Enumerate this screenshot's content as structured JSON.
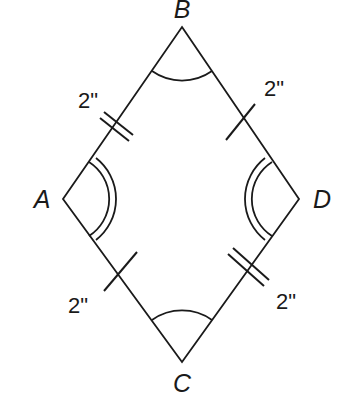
{
  "figure": {
    "type": "rhombus",
    "vertices": {
      "A": {
        "label": "A",
        "x": 63,
        "y": 199
      },
      "B": {
        "label": "B",
        "x": 182,
        "y": 27
      },
      "C": {
        "label": "C",
        "x": 182,
        "y": 362
      },
      "D": {
        "label": "D",
        "x": 299,
        "y": 199
      }
    },
    "sides": [
      {
        "name": "AB",
        "length_label": "2\"",
        "tick_marks": 2
      },
      {
        "name": "BD",
        "length_label": "2\"",
        "tick_marks": 1
      },
      {
        "name": "AC",
        "length_label": "2\"",
        "tick_marks": 1
      },
      {
        "name": "CD",
        "length_label": "2\"",
        "tick_marks": 2
      }
    ],
    "angle_marks": [
      {
        "vertex": "B",
        "arcs": 1
      },
      {
        "vertex": "C",
        "arcs": 1
      },
      {
        "vertex": "A",
        "arcs": 2
      },
      {
        "vertex": "D",
        "arcs": 2
      }
    ],
    "stroke_color": "#1a1a1a",
    "background_color": "#ffffff"
  },
  "labels": {
    "vertex_A": "A",
    "vertex_B": "B",
    "vertex_C": "C",
    "vertex_D": "D",
    "side_AB": "2\"",
    "side_BD": "2\"",
    "side_AC": "2\"",
    "side_CD": "2\""
  }
}
